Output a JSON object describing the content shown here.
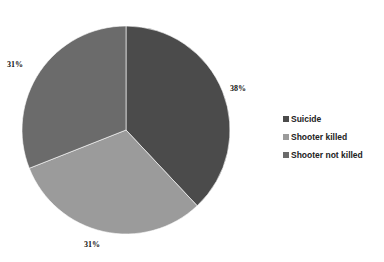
{
  "chart_data": {
    "type": "pie",
    "title": "",
    "categories": [
      "Suicide",
      "Shooter killed",
      "Shooter not killed"
    ],
    "values": [
      38,
      31,
      31
    ],
    "unit": "%",
    "data_labels": [
      "38%",
      "31%",
      "31%"
    ],
    "colors": [
      "#4b4b4b",
      "#9b9b9b",
      "#6b6b6b"
    ],
    "start_angle_deg": 0,
    "direction": "clockwise",
    "legend_position": "right"
  },
  "labels": {
    "suicide": "38%",
    "shooter_killed": "31%",
    "shooter_not_killed": "31%"
  },
  "legend": {
    "items": [
      {
        "label": "Suicide",
        "color": "#4b4b4b"
      },
      {
        "label": "Shooter killed",
        "color": "#9b9b9b"
      },
      {
        "label": "Shooter not killed",
        "color": "#6b6b6b"
      }
    ]
  }
}
